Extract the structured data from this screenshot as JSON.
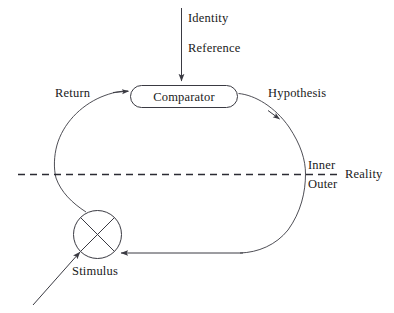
{
  "figure": {
    "type": "block-diagram",
    "background_color": "#ffffff",
    "line_color": "#3a3a42",
    "text_color": "#1a1a1a"
  },
  "nodes": {
    "comparator": {
      "label": "Comparator",
      "shape": "rounded-rectangle",
      "x": 130,
      "y": 85,
      "width": 108,
      "height": 23
    },
    "summing_junction": {
      "label": "Stimulus",
      "shape": "circle-with-cross",
      "cx": 97,
      "cy": 234,
      "r": 24
    }
  },
  "labels": {
    "identity": "Identity",
    "reference": "Reference",
    "comparator": "Comparator",
    "return": "Return",
    "hypothesis": "Hypothesis",
    "inner": "Inner",
    "outer": "Outer",
    "reality": "Reality",
    "stimulus": "Stimulus"
  },
  "boundary": {
    "name": "reality-boundary",
    "style": "dashed-horizontal",
    "y": 174,
    "above_label": "Inner",
    "below_label": "Outer",
    "side_label": "Reality"
  },
  "edges": [
    {
      "name": "identity-reference-input",
      "from": "Identity / Reference",
      "to": "Comparator",
      "direction": "down",
      "arrow": true
    },
    {
      "name": "return-edge",
      "from": "Stimulus",
      "to": "Comparator",
      "label": "Return",
      "arrow": true
    },
    {
      "name": "hypothesis-edge",
      "from": "Comparator",
      "to": "Stimulus",
      "label": "Hypothesis",
      "arrow": true
    },
    {
      "name": "stimulus-external-input",
      "from": "external",
      "to": "Stimulus",
      "arrow": true
    }
  ]
}
